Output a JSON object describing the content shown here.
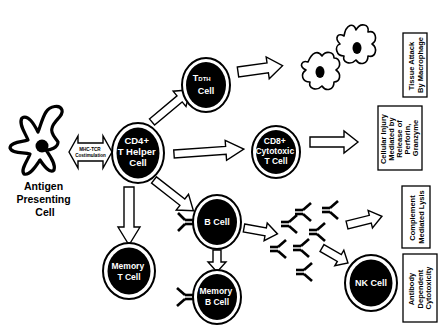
{
  "diagram": {
    "type": "immune-response-pathway",
    "nodes": {
      "apc": {
        "label_lines": [
          "Antigen",
          "Presenting",
          "Cell"
        ]
      },
      "costim": {
        "label_lines": [
          "MHC-TCR",
          "Costimulation"
        ]
      },
      "cd4": {
        "label_lines": [
          "CD4+",
          "T Helper",
          "Cell"
        ]
      },
      "tdth": {
        "label_main": "T",
        "label_sub": "DTH",
        "label_line2": "Cell"
      },
      "cd8": {
        "label_lines": [
          "CD8+",
          "Cytotoxic",
          "T Cell"
        ]
      },
      "bcell": {
        "label": "B Cell"
      },
      "memory_t": {
        "label_lines": [
          "Memory",
          "T Cell"
        ]
      },
      "memory_b": {
        "label_lines": [
          "Memory",
          "B Cell"
        ]
      },
      "nk": {
        "label": "NK Cell"
      }
    },
    "outcomes": {
      "tissue_attack": {
        "label_lines": [
          "Tissue Attack",
          "By Macrophage"
        ]
      },
      "cellular_injury": {
        "label_lines": [
          "Cellular Injury",
          "Mediated by",
          "Release of",
          "Perforin,",
          "Granzyme"
        ]
      },
      "complement": {
        "label_lines": [
          "Complement",
          "Mediated Lysis"
        ]
      },
      "adcc": {
        "label_lines": [
          "Antibody",
          "Dependent",
          "Cytotoxicity"
        ]
      }
    },
    "edges": [
      {
        "from": "apc",
        "to": "cd4",
        "kind": "bidirectional"
      },
      {
        "from": "cd4",
        "to": "tdth"
      },
      {
        "from": "cd4",
        "to": "cd8"
      },
      {
        "from": "cd4",
        "to": "bcell"
      },
      {
        "from": "cd4",
        "to": "memory_t"
      },
      {
        "from": "tdth",
        "to": "macrophages"
      },
      {
        "from": "cd8",
        "to": "cellular_injury"
      },
      {
        "from": "bcell",
        "to": "memory_b"
      },
      {
        "from": "bcell",
        "to": "antibodies"
      },
      {
        "from": "antibodies",
        "to": "complement"
      },
      {
        "from": "antibodies",
        "to": "nk"
      }
    ],
    "colors": {
      "ink": "#000000",
      "paper": "#ffffff"
    }
  }
}
